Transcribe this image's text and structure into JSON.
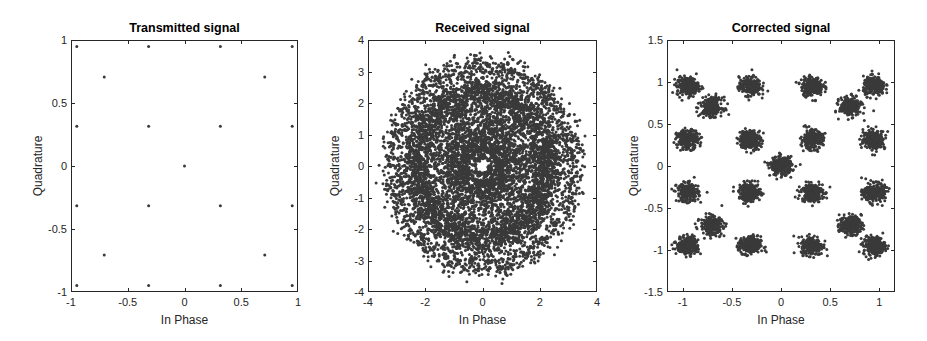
{
  "figure": {
    "width": 927,
    "height": 341,
    "marker_color": "#3a3a3a",
    "axis_color": "#262626"
  },
  "chart_data": [
    {
      "type": "scatter",
      "title": "Transmitted signal",
      "xlabel": "In Phase",
      "ylabel": "Quadrature",
      "xlim": [
        -1,
        1
      ],
      "ylim": [
        -1,
        1
      ],
      "xticks": [
        -1,
        -0.5,
        0,
        0.5,
        1
      ],
      "xtick_labels": [
        "-1",
        "-0.5",
        "0",
        "0.5",
        "1"
      ],
      "yticks": [
        -1,
        -0.5,
        0,
        0.5,
        1
      ],
      "ytick_labels": [
        "-1",
        "-0.5",
        "0",
        "0.5",
        "1"
      ],
      "grid": false,
      "legend": null,
      "box_px": {
        "left": 71,
        "top": 40,
        "right": 298,
        "bottom": 292
      },
      "points": [
        [
          -0.949,
          0.949
        ],
        [
          -0.316,
          0.949
        ],
        [
          0.316,
          0.949
        ],
        [
          0.949,
          0.949
        ],
        [
          -0.707,
          0.707
        ],
        [
          0.707,
          0.707
        ],
        [
          -0.949,
          0.316
        ],
        [
          -0.316,
          0.316
        ],
        [
          0.316,
          0.316
        ],
        [
          0.949,
          0.316
        ],
        [
          0,
          0
        ],
        [
          -0.949,
          -0.316
        ],
        [
          -0.316,
          -0.316
        ],
        [
          0.316,
          -0.316
        ],
        [
          0.949,
          -0.316
        ],
        [
          -0.707,
          -0.707
        ],
        [
          0.707,
          -0.707
        ],
        [
          -0.949,
          -0.949
        ],
        [
          -0.316,
          -0.949
        ],
        [
          0.316,
          -0.949
        ],
        [
          0.949,
          -0.949
        ]
      ],
      "marker_size": 3
    },
    {
      "type": "scatter",
      "title": "Received signal",
      "xlabel": "In Phase",
      "ylabel": "Quadrature",
      "xlim": [
        -4,
        4
      ],
      "ylim": [
        -4,
        4
      ],
      "xticks": [
        -4,
        -2,
        0,
        2,
        4
      ],
      "xtick_labels": [
        "-4",
        "-2",
        "0",
        "2",
        "4"
      ],
      "yticks": [
        -4,
        -3,
        -2,
        -1,
        0,
        1,
        2,
        3,
        4
      ],
      "ytick_labels": [
        "-4",
        "-3",
        "-2",
        "-1",
        "0",
        "1",
        "2",
        "3",
        "4"
      ],
      "grid": false,
      "legend": null,
      "box_px": {
        "left": 368,
        "top": 40,
        "right": 597,
        "bottom": 292
      },
      "description": "Rotationally smeared constellation: dense disk of radius ~2.7, sparser outer ring at radius ~3.0-3.5, small hollow ring near origin (radius ~0.3)",
      "rings": [
        {
          "radius": 0.3,
          "spread": 0.05,
          "count": 120
        },
        {
          "radius": 1.2,
          "spread": 0.7,
          "count": 4200
        },
        {
          "radius": 2.3,
          "spread": 0.25,
          "count": 2200
        },
        {
          "radius": 3.15,
          "spread": 0.22,
          "count": 1600
        }
      ],
      "marker_size": 3
    },
    {
      "type": "scatter",
      "title": "Corrected signal",
      "xlabel": "In Phase",
      "ylabel": "Quadrature",
      "xlim": [
        -1.16,
        1.16
      ],
      "ylim": [
        -1.5,
        1.5
      ],
      "xticks": [
        -1,
        -0.5,
        0,
        0.5,
        1
      ],
      "xtick_labels": [
        "-1",
        "-0.5",
        "0",
        "0.5",
        "1"
      ],
      "yticks": [
        -1.5,
        -1,
        -0.5,
        0,
        0.5,
        1,
        1.5
      ],
      "ytick_labels": [
        "-1.5",
        "-1",
        "-0.5",
        "0",
        "0.5",
        "1",
        "1.5"
      ],
      "grid": false,
      "legend": null,
      "box_px": {
        "left": 667,
        "top": 40,
        "right": 895,
        "bottom": 292
      },
      "cluster_centers": [
        [
          -0.949,
          0.949
        ],
        [
          -0.316,
          0.949
        ],
        [
          0.316,
          0.949
        ],
        [
          0.949,
          0.949
        ],
        [
          -0.707,
          0.707
        ],
        [
          0.707,
          0.707
        ],
        [
          -0.949,
          0.316
        ],
        [
          -0.316,
          0.316
        ],
        [
          0.316,
          0.316
        ],
        [
          0.949,
          0.316
        ],
        [
          0,
          0
        ],
        [
          -0.949,
          -0.316
        ],
        [
          -0.316,
          -0.316
        ],
        [
          0.316,
          -0.316
        ],
        [
          0.949,
          -0.316
        ],
        [
          -0.707,
          -0.707
        ],
        [
          0.707,
          -0.707
        ],
        [
          -0.949,
          -0.949
        ],
        [
          -0.316,
          -0.949
        ],
        [
          0.316,
          -0.949
        ],
        [
          0.949,
          -0.949
        ]
      ],
      "cluster_spread": 0.055,
      "points_per_cluster": 260,
      "marker_size": 3
    }
  ]
}
